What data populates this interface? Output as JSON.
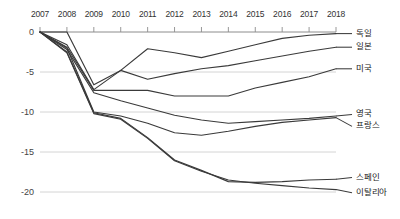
{
  "chart_data": {
    "type": "line",
    "title": "",
    "subtitle": "",
    "xlabel": "",
    "ylabel": "",
    "x_axis_position": "top",
    "grid": "horizontal",
    "legend_position": "right-inline",
    "categories": [
      2007,
      2008,
      2009,
      2010,
      2011,
      2012,
      2013,
      2014,
      2015,
      2016,
      2017,
      2018
    ],
    "xlim": [
      2007,
      2018
    ],
    "ylim": [
      -21.5,
      0.6
    ],
    "ytick_labels": [
      "0",
      "-5",
      "-10",
      "-15",
      "-20"
    ],
    "ytick_values": [
      0,
      -5,
      -10,
      -15,
      -20
    ],
    "xtick_labels": [
      "2007",
      "2008",
      "2009",
      "2010",
      "2011",
      "2012",
      "2013",
      "2014",
      "2015",
      "2016",
      "2017",
      "2018"
    ],
    "line_color": "#3a3a3a",
    "grid_color": "#c9c9c9",
    "axis_color": "#8c8c8c",
    "series": [
      {
        "name": "독일",
        "label": "독일",
        "values": [
          0,
          0,
          -6.6,
          -4.8,
          -2.1,
          -2.6,
          -3.2,
          -2.4,
          -1.6,
          -0.8,
          -0.4,
          -0.2
        ]
      },
      {
        "name": "일본",
        "label": "일본",
        "values": [
          0,
          -1.6,
          -7.2,
          -4.8,
          -5.9,
          -5.2,
          -4.6,
          -4.2,
          -3.6,
          -3.0,
          -2.4,
          -1.9
        ]
      },
      {
        "name": "미국",
        "label": "미국",
        "values": [
          0,
          -1.9,
          -7.3,
          -7.3,
          -7.3,
          -8.0,
          -8.0,
          -8.0,
          -7.0,
          -6.3,
          -5.6,
          -4.6
        ]
      },
      {
        "name": "영국",
        "label": "영국",
        "values": [
          0,
          -2.2,
          -7.6,
          -8.6,
          -9.5,
          -10.4,
          -11.0,
          -11.4,
          -11.2,
          -11.0,
          -10.8,
          -10.5
        ]
      },
      {
        "name": "프랑스",
        "label": "프랑스",
        "values": [
          0,
          -2.0,
          -10.0,
          -10.5,
          -11.4,
          -12.6,
          -12.9,
          -12.4,
          -11.8,
          -11.3,
          -11.0,
          -10.7
        ]
      },
      {
        "name": "스페인",
        "label": "스페인",
        "values": [
          0,
          -2.5,
          -10.1,
          -10.8,
          -13.2,
          -16.0,
          -17.3,
          -18.7,
          -18.8,
          -18.7,
          -18.5,
          -18.4
        ]
      },
      {
        "name": "이탈리아",
        "label": "이탈리아",
        "values": [
          0,
          -2.6,
          -10.2,
          -10.9,
          -13.3,
          -16.1,
          -17.4,
          -18.5,
          -18.9,
          -19.2,
          -19.5,
          -19.7
        ]
      }
    ],
    "series_label_positions": [
      {
        "name": "독일",
        "y_value": -0.2
      },
      {
        "name": "일본",
        "y_value": -1.9
      },
      {
        "name": "미국",
        "y_value": -4.6
      },
      {
        "name": "영국",
        "y_value": -10.3
      },
      {
        "name": "프랑스",
        "y_value": -11.8
      },
      {
        "name": "스페인",
        "y_value": -18.2
      },
      {
        "name": "이탈리아",
        "y_value": -20.1
      }
    ]
  }
}
